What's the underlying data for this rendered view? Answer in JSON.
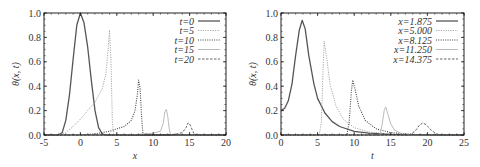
{
  "chart_data": [
    {
      "type": "line",
      "panel": "left",
      "title": "",
      "xlabel": "x",
      "ylabel": "θ(x, t)",
      "xlim": [
        -5,
        20
      ],
      "ylim": [
        0,
        1.0
      ],
      "xticks": [
        -5,
        0,
        5,
        10,
        15,
        20
      ],
      "yticks": [
        0.0,
        0.2,
        0.4,
        0.6,
        0.8,
        1.0
      ],
      "ytick_labels": [
        "0.0",
        "0.2",
        "0.4",
        "0.6",
        "0.8",
        "1.0"
      ],
      "grid": false,
      "legend_position": "upper right",
      "series": [
        {
          "name": "t = 0",
          "label": "t=0",
          "style": "solid",
          "color": "#555555",
          "points": [
            [
              -5,
              0
            ],
            [
              -3,
              0
            ],
            [
              -2.5,
              0.02
            ],
            [
              -2,
              0.12
            ],
            [
              -1.5,
              0.33
            ],
            [
              -1,
              0.62
            ],
            [
              -0.5,
              0.9
            ],
            [
              0,
              1.0
            ],
            [
              0.5,
              0.92
            ],
            [
              1,
              0.72
            ],
            [
              1.5,
              0.45
            ],
            [
              2,
              0.2
            ],
            [
              2.5,
              0.06
            ],
            [
              3,
              0.01
            ],
            [
              3.5,
              0
            ],
            [
              20,
              0
            ]
          ]
        },
        {
          "name": "t = 5",
          "label": "t=5",
          "style": "dotted-light",
          "color": "#aaaaaa",
          "points": [
            [
              -5,
              0
            ],
            [
              -3,
              0
            ],
            [
              -2,
              0.02
            ],
            [
              -1,
              0.07
            ],
            [
              0,
              0.13
            ],
            [
              1,
              0.2
            ],
            [
              2,
              0.27
            ],
            [
              3,
              0.38
            ],
            [
              3.5,
              0.5
            ],
            [
              3.8,
              0.7
            ],
            [
              4.0,
              0.86
            ],
            [
              4.2,
              0.6
            ],
            [
              4.4,
              0.1
            ],
            [
              4.6,
              0
            ],
            [
              20,
              0
            ]
          ]
        },
        {
          "name": "t = 10",
          "label": "t=10",
          "style": "dotted",
          "color": "#444444",
          "points": [
            [
              -5,
              0
            ],
            [
              0,
              0
            ],
            [
              2,
              0.01
            ],
            [
              4,
              0.03
            ],
            [
              6,
              0.07
            ],
            [
              7,
              0.12
            ],
            [
              7.5,
              0.2
            ],
            [
              7.8,
              0.32
            ],
            [
              8.0,
              0.45
            ],
            [
              8.2,
              0.38
            ],
            [
              8.4,
              0.15
            ],
            [
              8.6,
              0
            ],
            [
              20,
              0
            ]
          ]
        },
        {
          "name": "t = 15",
          "label": "t=15",
          "style": "solid-light",
          "color": "#bbbbbb",
          "points": [
            [
              -5,
              0
            ],
            [
              5,
              0
            ],
            [
              8,
              0.005
            ],
            [
              10,
              0.015
            ],
            [
              11,
              0.03
            ],
            [
              11.4,
              0.1
            ],
            [
              11.6,
              0.19
            ],
            [
              11.8,
              0.21
            ],
            [
              12.0,
              0.15
            ],
            [
              12.2,
              0.05
            ],
            [
              12.4,
              0
            ],
            [
              20,
              0
            ]
          ]
        },
        {
          "name": "t = 20",
          "label": "t=20",
          "style": "dashed",
          "color": "#666666",
          "points": [
            [
              -5,
              0
            ],
            [
              10,
              0
            ],
            [
              13,
              0.005
            ],
            [
              14,
              0.02
            ],
            [
              14.5,
              0.06
            ],
            [
              14.8,
              0.1
            ],
            [
              15.0,
              0.09
            ],
            [
              15.3,
              0.05
            ],
            [
              15.6,
              0.01
            ],
            [
              16,
              0
            ],
            [
              20,
              0
            ]
          ]
        }
      ]
    },
    {
      "type": "line",
      "panel": "right",
      "title": "",
      "xlabel": "t",
      "ylabel": "θ(x, t)",
      "xlim": [
        0,
        25
      ],
      "ylim": [
        0,
        1.0
      ],
      "xticks": [
        0,
        5,
        10,
        15,
        20,
        25
      ],
      "yticks": [
        0.0,
        0.2,
        0.4,
        0.6,
        0.8,
        1.0
      ],
      "ytick_labels": [
        "0.0",
        "0.2",
        "0.4",
        "0.6",
        "0.8",
        "1.0"
      ],
      "grid": false,
      "legend_position": "upper right",
      "series": [
        {
          "name": "x = 1.875",
          "label": "x=1.875",
          "style": "solid",
          "color": "#555555",
          "points": [
            [
              0,
              0.2
            ],
            [
              0.5,
              0.22
            ],
            [
              1,
              0.28
            ],
            [
              1.5,
              0.42
            ],
            [
              2,
              0.65
            ],
            [
              2.5,
              0.86
            ],
            [
              2.9,
              0.94
            ],
            [
              3.3,
              0.87
            ],
            [
              3.8,
              0.65
            ],
            [
              4.5,
              0.42
            ],
            [
              5,
              0.3
            ],
            [
              6,
              0.18
            ],
            [
              7,
              0.11
            ],
            [
              8,
              0.07
            ],
            [
              10,
              0.03
            ],
            [
              12,
              0.015
            ],
            [
              15,
              0.005
            ],
            [
              20,
              0
            ],
            [
              25,
              0
            ]
          ]
        },
        {
          "name": "x = 5.000",
          "label": "x=5.000",
          "style": "dotted-light",
          "color": "#aaaaaa",
          "points": [
            [
              0,
              0
            ],
            [
              5.2,
              0
            ],
            [
              5.5,
              0.1
            ],
            [
              5.7,
              0.45
            ],
            [
              5.9,
              0.77
            ],
            [
              6.2,
              0.65
            ],
            [
              6.7,
              0.42
            ],
            [
              7.5,
              0.24
            ],
            [
              8.5,
              0.13
            ],
            [
              10,
              0.06
            ],
            [
              12,
              0.025
            ],
            [
              15,
              0.008
            ],
            [
              20,
              0
            ],
            [
              25,
              0
            ]
          ]
        },
        {
          "name": "x = 8.125",
          "label": "x=8.125",
          "style": "dotted",
          "color": "#444444",
          "points": [
            [
              0,
              0
            ],
            [
              9.0,
              0
            ],
            [
              9.3,
              0.1
            ],
            [
              9.6,
              0.35
            ],
            [
              9.8,
              0.45
            ],
            [
              10.1,
              0.38
            ],
            [
              10.6,
              0.24
            ],
            [
              11.5,
              0.12
            ],
            [
              13,
              0.05
            ],
            [
              15,
              0.02
            ],
            [
              18,
              0.005
            ],
            [
              25,
              0
            ]
          ]
        },
        {
          "name": "x = 11.250",
          "label": "x=11.250",
          "style": "solid-light",
          "color": "#bbbbbb",
          "points": [
            [
              0,
              0
            ],
            [
              13.5,
              0
            ],
            [
              13.8,
              0.08
            ],
            [
              14.1,
              0.2
            ],
            [
              14.3,
              0.23
            ],
            [
              14.6,
              0.17
            ],
            [
              15.0,
              0.09
            ],
            [
              15.5,
              0.04
            ],
            [
              16.5,
              0.01
            ],
            [
              18,
              0
            ],
            [
              25,
              0
            ]
          ]
        },
        {
          "name": "x = 14.375",
          "label": "x=14.375",
          "style": "dashed",
          "color": "#666666",
          "points": [
            [
              0,
              0
            ],
            [
              17.5,
              0
            ],
            [
              18.3,
              0.03
            ],
            [
              18.9,
              0.08
            ],
            [
              19.4,
              0.1
            ],
            [
              19.9,
              0.08
            ],
            [
              20.5,
              0.04
            ],
            [
              21.2,
              0.01
            ],
            [
              22,
              0
            ],
            [
              25,
              0
            ]
          ]
        }
      ]
    }
  ]
}
